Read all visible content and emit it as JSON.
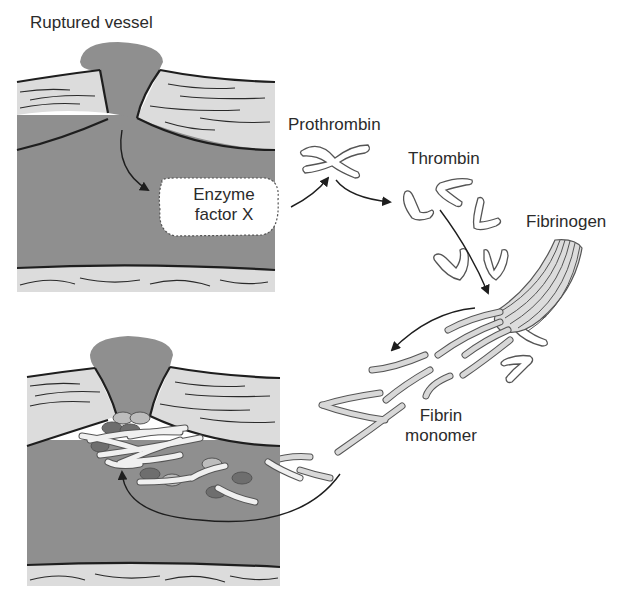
{
  "diagram": {
    "type": "biological-process",
    "labels": {
      "ruptured_vessel": "Ruptured vessel",
      "enzyme_line1": "Enzyme",
      "enzyme_line2": "factor X",
      "prothrombin": "Prothrombin",
      "thrombin": "Thrombin",
      "fibrinogen": "Fibrinogen",
      "fibrin_line1": "Fibrin",
      "fibrin_line2": "monomer"
    },
    "flow": [
      {
        "from": "Ruptured vessel",
        "to": "Enzyme factor X"
      },
      {
        "from": "Enzyme factor X",
        "to": "Prothrombin"
      },
      {
        "from": "Prothrombin",
        "to": "Thrombin"
      },
      {
        "from": "Thrombin",
        "to": "Fibrinogen"
      },
      {
        "from": "Fibrinogen",
        "to": "Fibrin monomer"
      },
      {
        "from": "Fibrin monomer",
        "to": "Clot at ruptured vessel"
      }
    ],
    "colors": {
      "blood": "#8f8f8f",
      "vessel_wall": "#dcdcdc",
      "outline": "#1e1e1e",
      "protein_fill": "#ffffff",
      "fibrin_fill": "#d8d8d8",
      "platelet_dark": "#6e6e6e",
      "platelet_light": "#bdbdbd"
    }
  }
}
